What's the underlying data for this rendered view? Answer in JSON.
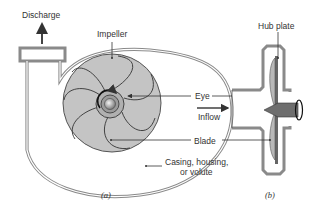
{
  "figure": {
    "labels": {
      "discharge": "Discharge",
      "impeller": "Impeller",
      "eye": "Eye",
      "inflow": "Inflow",
      "blade": "Blade",
      "casing_line1": "Casing, housing,",
      "casing_line2": "or volute",
      "hub_plate": "Hub plate"
    },
    "captions": {
      "a": "(a)",
      "b": "(b)"
    },
    "colors": {
      "casing": "#8a8a8a",
      "impeller_fill": "#c4c4c4",
      "hub_fill": "#6e6e6e",
      "line": "#333333"
    }
  }
}
